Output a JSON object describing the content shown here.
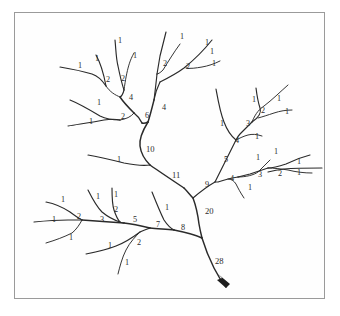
{
  "figure": {
    "type": "diagram",
    "style": "hand-drawn line drawing",
    "background_color": "#ffffff",
    "border_color": "#9a9a9a",
    "stroke_color": "#2a2a2a",
    "label_color": "#2b2b2b",
    "outlet_label": "28",
    "outlet_marker": "arrowhead"
  },
  "chart_data": {
    "type": "diagram",
    "outlet_magnitude": 28,
    "exterior_link_count": 28,
    "labels": [
      {
        "id": "L01",
        "value": "1",
        "x": 118,
        "y": 43
      },
      {
        "id": "L02",
        "value": "1",
        "x": 180,
        "y": 39
      },
      {
        "id": "L03",
        "value": "1",
        "x": 205,
        "y": 45
      },
      {
        "id": "L04",
        "value": "1",
        "x": 78,
        "y": 68
      },
      {
        "id": "L05",
        "value": "1",
        "x": 95,
        "y": 61
      },
      {
        "id": "L06",
        "value": "1",
        "x": 133,
        "y": 58
      },
      {
        "id": "L07",
        "value": "2",
        "x": 106,
        "y": 82
      },
      {
        "id": "L08",
        "value": "2",
        "x": 121,
        "y": 81
      },
      {
        "id": "L09",
        "value": "2",
        "x": 163,
        "y": 66
      },
      {
        "id": "L10",
        "value": "2",
        "x": 186,
        "y": 69
      },
      {
        "id": "L11",
        "value": "1",
        "x": 210,
        "y": 54
      },
      {
        "id": "L12",
        "value": "1",
        "x": 212,
        "y": 66
      },
      {
        "id": "L13",
        "value": "4",
        "x": 129,
        "y": 100
      },
      {
        "id": "L14",
        "value": "4",
        "x": 162,
        "y": 110
      },
      {
        "id": "L15",
        "value": "1",
        "x": 97,
        "y": 105
      },
      {
        "id": "L16",
        "value": "1",
        "x": 89,
        "y": 124
      },
      {
        "id": "L17",
        "value": "2",
        "x": 121,
        "y": 119
      },
      {
        "id": "L18",
        "value": "6",
        "x": 145,
        "y": 118
      },
      {
        "id": "L19",
        "value": "10",
        "x": 146,
        "y": 152
      },
      {
        "id": "L20",
        "value": "1",
        "x": 117,
        "y": 162
      },
      {
        "id": "L21",
        "value": "11",
        "x": 172,
        "y": 178
      },
      {
        "id": "L22",
        "value": "1",
        "x": 220,
        "y": 126
      },
      {
        "id": "L23",
        "value": "1",
        "x": 252,
        "y": 102
      },
      {
        "id": "L24",
        "value": "1",
        "x": 277,
        "y": 101
      },
      {
        "id": "L25",
        "value": "2",
        "x": 261,
        "y": 113
      },
      {
        "id": "L26",
        "value": "1",
        "x": 285,
        "y": 114
      },
      {
        "id": "L27",
        "value": "3",
        "x": 246,
        "y": 126
      },
      {
        "id": "L28",
        "value": "4",
        "x": 235,
        "y": 143
      },
      {
        "id": "L29",
        "value": "1",
        "x": 255,
        "y": 139
      },
      {
        "id": "L30",
        "value": "5",
        "x": 224,
        "y": 162
      },
      {
        "id": "L31",
        "value": "9",
        "x": 205,
        "y": 187
      },
      {
        "id": "L32",
        "value": "4",
        "x": 230,
        "y": 181
      },
      {
        "id": "L33",
        "value": "1",
        "x": 248,
        "y": 190
      },
      {
        "id": "L34",
        "value": "3",
        "x": 258,
        "y": 177
      },
      {
        "id": "L35",
        "value": "1",
        "x": 256,
        "y": 160
      },
      {
        "id": "L36",
        "value": "2",
        "x": 278,
        "y": 176
      },
      {
        "id": "L37",
        "value": "1",
        "x": 274,
        "y": 154
      },
      {
        "id": "L38",
        "value": "1",
        "x": 297,
        "y": 164
      },
      {
        "id": "L39",
        "value": "1",
        "x": 297,
        "y": 175
      },
      {
        "id": "L40",
        "value": "20",
        "x": 205,
        "y": 214
      },
      {
        "id": "L41",
        "value": "28",
        "x": 215,
        "y": 264
      },
      {
        "id": "L42",
        "value": "1",
        "x": 61,
        "y": 202
      },
      {
        "id": "L43",
        "value": "1",
        "x": 52,
        "y": 222
      },
      {
        "id": "L44",
        "value": "1",
        "x": 69,
        "y": 240
      },
      {
        "id": "L45",
        "value": "2",
        "x": 77,
        "y": 219
      },
      {
        "id": "L46",
        "value": "3",
        "x": 100,
        "y": 222
      },
      {
        "id": "L47",
        "value": "1",
        "x": 96,
        "y": 199
      },
      {
        "id": "L48",
        "value": "1",
        "x": 114,
        "y": 197
      },
      {
        "id": "L49",
        "value": "2",
        "x": 114,
        "y": 212
      },
      {
        "id": "L50",
        "value": "5",
        "x": 133,
        "y": 222
      },
      {
        "id": "L51",
        "value": "7",
        "x": 156,
        "y": 227
      },
      {
        "id": "L52",
        "value": "1",
        "x": 165,
        "y": 210
      },
      {
        "id": "L53",
        "value": "8",
        "x": 181,
        "y": 230
      },
      {
        "id": "L54",
        "value": "2",
        "x": 137,
        "y": 245
      },
      {
        "id": "L55",
        "value": "1",
        "x": 108,
        "y": 248
      },
      {
        "id": "L56",
        "value": "1",
        "x": 125,
        "y": 265
      }
    ],
    "junctions": [
      {
        "inputs": [
          1,
          1
        ],
        "output": 2,
        "label": "2",
        "region": "upper-left-a"
      },
      {
        "inputs": [
          1,
          1
        ],
        "output": 2,
        "label": "2",
        "region": "upper-left-b"
      },
      {
        "inputs": [
          2,
          2
        ],
        "output": 4,
        "label": "4",
        "region": "upper-left"
      },
      {
        "inputs": [
          1,
          1
        ],
        "output": 2,
        "label": "2",
        "region": "left-mid"
      },
      {
        "inputs": [
          4,
          2
        ],
        "output": 6,
        "label": "6",
        "region": "upper-center"
      },
      {
        "inputs": [
          1,
          1
        ],
        "output": 2,
        "label": "2",
        "region": "top-center"
      },
      {
        "inputs": [
          1,
          1
        ],
        "output": 2,
        "label": "2",
        "region": "top-right-of-center"
      },
      {
        "inputs": [
          2,
          2
        ],
        "output": 4,
        "label": "4",
        "region": "top-center-trunk"
      },
      {
        "inputs": [
          6,
          4
        ],
        "output": 10,
        "label": "10",
        "region": "center"
      },
      {
        "inputs": [
          10,
          1
        ],
        "output": 11,
        "label": "11",
        "region": "center-trunk"
      },
      {
        "inputs": [
          1,
          1
        ],
        "output": 2,
        "label": "2",
        "region": "upper-right"
      },
      {
        "inputs": [
          2,
          1
        ],
        "output": 3,
        "label": "3",
        "region": "upper-right"
      },
      {
        "inputs": [
          3,
          1
        ],
        "output": 4,
        "label": "4",
        "region": "right"
      },
      {
        "inputs": [
          4,
          1
        ],
        "output": 5,
        "label": "5",
        "region": "right"
      },
      {
        "inputs": [
          1,
          1
        ],
        "output": 2,
        "label": "2",
        "region": "lower-right"
      },
      {
        "inputs": [
          2,
          1
        ],
        "output": 3,
        "label": "3",
        "region": "lower-right"
      },
      {
        "inputs": [
          3,
          1
        ],
        "output": 4,
        "label": "4",
        "region": "lower-right"
      },
      {
        "inputs": [
          5,
          4
        ],
        "output": 9,
        "label": "9",
        "region": "right-trunk"
      },
      {
        "inputs": [
          11,
          9
        ],
        "output": 20,
        "label": "20",
        "region": "main-trunk"
      },
      {
        "inputs": [
          1,
          1
        ],
        "output": 2,
        "label": "2",
        "region": "bottom-left"
      },
      {
        "inputs": [
          2,
          1
        ],
        "output": 3,
        "label": "3",
        "region": "bottom-left"
      },
      {
        "inputs": [
          1,
          1
        ],
        "output": 2,
        "label": "2",
        "region": "bottom-center-upper"
      },
      {
        "inputs": [
          3,
          2
        ],
        "output": 5,
        "label": "5",
        "region": "bottom-left-trunk"
      },
      {
        "inputs": [
          1,
          1
        ],
        "output": 2,
        "label": "2",
        "region": "bottom-center-lower"
      },
      {
        "inputs": [
          5,
          2
        ],
        "output": 7,
        "label": "7",
        "region": "bottom-trunk"
      },
      {
        "inputs": [
          7,
          1
        ],
        "output": 8,
        "label": "8",
        "region": "bottom-trunk"
      },
      {
        "inputs": [
          20,
          8
        ],
        "output": 28,
        "label": "28",
        "region": "outlet"
      }
    ]
  }
}
